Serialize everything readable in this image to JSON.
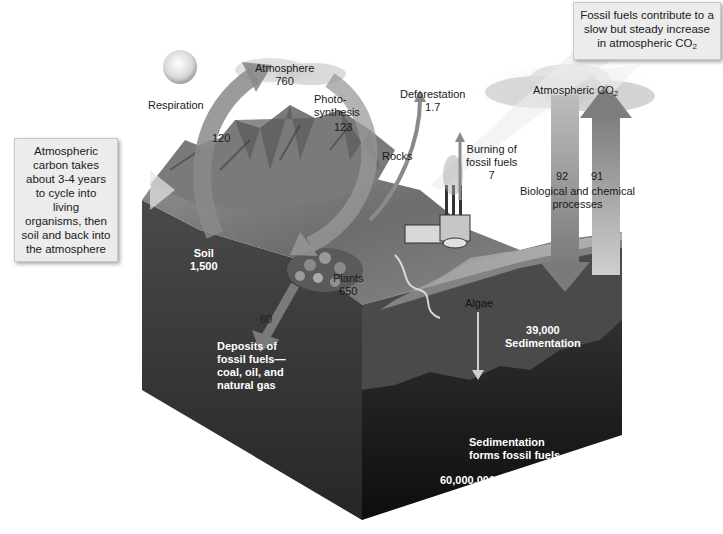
{
  "diagram": {
    "type": "carbon-cycle",
    "palette": {
      "background": "#ffffff",
      "block_top": "#6b6b6b",
      "block_side_dark": "#2a2a2a",
      "block_front_deep": "#0f0f0f",
      "arrow": "#8a8a8a",
      "arrow_dark": "#6e6e6e",
      "cloud": "#d6d6d6",
      "callout_bg": "#ececec"
    },
    "callouts": {
      "fossil_fuels_note": {
        "line1": "Fossil fuels contribute to a",
        "line2": "slow but steady increase",
        "line3_prefix": "in atmospheric CO",
        "line3_sub": "2"
      },
      "carbon_cycle_note": {
        "lines": [
          "Atmospheric",
          "carbon takes",
          "about 3-4 years",
          "to cycle into living",
          "organisms, then",
          "soil and back into",
          "the atmosphere"
        ]
      }
    },
    "labels": {
      "respiration": "Respiration",
      "atmosphere_name": "Atmosphere",
      "atmosphere_value": "760",
      "photosynthesis_line1": "Photo-",
      "photosynthesis_line2": "synthesis",
      "photosynthesis_value": "123",
      "respiration_value": "120",
      "deforestation_name": "Deforestation",
      "deforestation_value": "1.7",
      "rocks": "Rocks",
      "burning_line1": "Burning of",
      "burning_line2": "fossil fuels",
      "burning_value": "7",
      "atmospheric_co2_prefix": "Atmospheric CO",
      "atmospheric_co2_sub": "2",
      "ocean_down_value": "92",
      "ocean_up_value": "91",
      "bio_chem_line1": "Biological and chemical",
      "bio_chem_line2": "processes",
      "soil_name": "Soil",
      "soil_value": "1,500",
      "plants_name": "Plants",
      "plants_value": "650",
      "deposit_value": "60",
      "deposits_line1": "Deposits of",
      "deposits_line2": "fossil fuels—",
      "deposits_line3": "coal, oil, and",
      "deposits_line4": "natural gas",
      "algae": "Algae",
      "sedimentation_value": "39,000",
      "sedimentation_name": "Sedimentation",
      "sed_fossil_line1": "Sedimentation",
      "sed_fossil_line2": "forms fossil fuels.",
      "deep_value": "60,000,000"
    }
  }
}
